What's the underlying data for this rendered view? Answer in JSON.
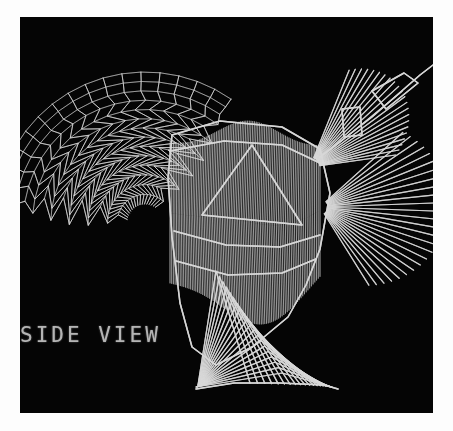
{
  "figure": {
    "kind": "wireframe-3d-plot",
    "label": "SIDE VIEW",
    "background_color": "#050505",
    "page_color": "#fdfdfd",
    "line_color": "#d8d8d8",
    "canvas": {
      "x": 20,
      "y": 17,
      "width": 413,
      "height": 396
    }
  },
  "chart_data": {
    "type": "line",
    "title": "SIDE VIEW",
    "subtitle": "",
    "xlabel": "",
    "ylabel": "",
    "grid": false,
    "legend": "none",
    "projection": "orthographic side elevation",
    "stroke_color": "#d8d8d8",
    "background_color": "#050505",
    "xlim": [
      0,
      413
    ],
    "ylim": [
      0,
      396
    ],
    "annotations": [
      {
        "text": "SIDE VIEW",
        "x": 2,
        "y": 318
      }
    ],
    "series": [
      {
        "name": "left-wing-lattice-fan",
        "kind": "radial-zigzag-fan",
        "hub": [
          125,
          205
        ],
        "rib_count": 17,
        "angle_start_deg": 188,
        "angle_end_deg": 305,
        "radius_inner": 18,
        "radius_outer": 150,
        "zigzag_amplitude": 13,
        "zigzag_segments": 7
      },
      {
        "name": "right-wing-ray-fan",
        "kind": "radial-ray-fan",
        "hub": [
          300,
          190
        ],
        "ray_count": 26,
        "angle_start_deg": 318,
        "angle_end_deg": 58,
        "radius_inner": 8,
        "radius_outer": 128
      },
      {
        "name": "upper-right-ray-fan",
        "kind": "radial-ray-fan",
        "hub": [
          290,
          150
        ],
        "ray_count": 22,
        "angle_start_deg": 292,
        "angle_end_deg": 352,
        "radius_inner": 10,
        "radius_outer": 120
      },
      {
        "name": "torso-mesh",
        "kind": "dense-vertical-hatch",
        "line_count": 88,
        "x_range": [
          150,
          300
        ],
        "y_range": [
          110,
          300
        ]
      },
      {
        "name": "torso-outline",
        "kind": "polyline",
        "points": [
          [
            152,
            118
          ],
          [
            200,
            104
          ],
          [
            262,
            110
          ],
          [
            300,
            132
          ],
          [
            310,
            176
          ],
          [
            300,
            232
          ],
          [
            286,
            268
          ],
          [
            268,
            300
          ],
          [
            232,
            330
          ],
          [
            196,
            348
          ],
          [
            172,
            330
          ],
          [
            160,
            286
          ],
          [
            152,
            220
          ],
          [
            148,
            160
          ],
          [
            152,
            118
          ]
        ]
      },
      {
        "name": "inner-arch-triangle",
        "kind": "polyline",
        "points": [
          [
            182,
            198
          ],
          [
            232,
            128
          ],
          [
            282,
            208
          ],
          [
            182,
            198
          ]
        ]
      },
      {
        "name": "shoulder-band",
        "kind": "polyline",
        "points": [
          [
            150,
            134
          ],
          [
            204,
            124
          ],
          [
            262,
            128
          ],
          [
            300,
            146
          ]
        ]
      },
      {
        "name": "waist-band",
        "kind": "polyline",
        "points": [
          [
            154,
            214
          ],
          [
            206,
            228
          ],
          [
            260,
            230
          ],
          [
            300,
            218
          ]
        ]
      },
      {
        "name": "hip-band",
        "kind": "polyline",
        "points": [
          [
            156,
            244
          ],
          [
            208,
            258
          ],
          [
            262,
            256
          ],
          [
            296,
            242
          ]
        ]
      },
      {
        "name": "leg-chevron-stack",
        "kind": "nested-chevrons",
        "count": 20,
        "apex_start": [
          196,
          254
        ],
        "apex_end": [
          262,
          356
        ],
        "left_foot": [
          176,
          370
        ],
        "right_foot": [
          312,
          370
        ]
      },
      {
        "name": "tail-tip-diamond",
        "kind": "polyline",
        "points": [
          [
            352,
            74
          ],
          [
            384,
            56
          ],
          [
            398,
            66
          ],
          [
            366,
            92
          ],
          [
            352,
            74
          ]
        ]
      },
      {
        "name": "tail-strut",
        "kind": "polyline",
        "points": [
          [
            300,
            140
          ],
          [
            352,
            100
          ],
          [
            400,
            58
          ],
          [
            413,
            48
          ]
        ]
      },
      {
        "name": "small-rectangle-marker",
        "kind": "polyline",
        "points": [
          [
            322,
            92
          ],
          [
            340,
            90
          ],
          [
            342,
            118
          ],
          [
            324,
            120
          ],
          [
            322,
            92
          ]
        ]
      },
      {
        "name": "ground-contact",
        "kind": "polyline",
        "points": [
          [
            176,
            372
          ],
          [
            214,
            366
          ],
          [
            260,
            366
          ],
          [
            304,
            368
          ],
          [
            318,
            372
          ]
        ]
      }
    ]
  }
}
